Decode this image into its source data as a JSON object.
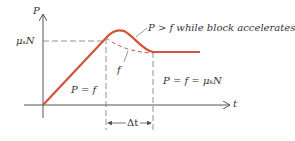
{
  "diagram": {
    "axes": {
      "y_label": "P",
      "x_label": "t"
    },
    "levels": {
      "static_level_label": "μₛN"
    },
    "annotations": {
      "accelerate_note": "P > f while block accelerates",
      "friction_curve_label": "f",
      "static_region_label": "P = f",
      "kinetic_region_label": "P = f = μₖN",
      "interval_label": "Δt"
    },
    "colors": {
      "curve": "#d0533a",
      "axis": "#555555",
      "dashed": "#777777"
    }
  }
}
